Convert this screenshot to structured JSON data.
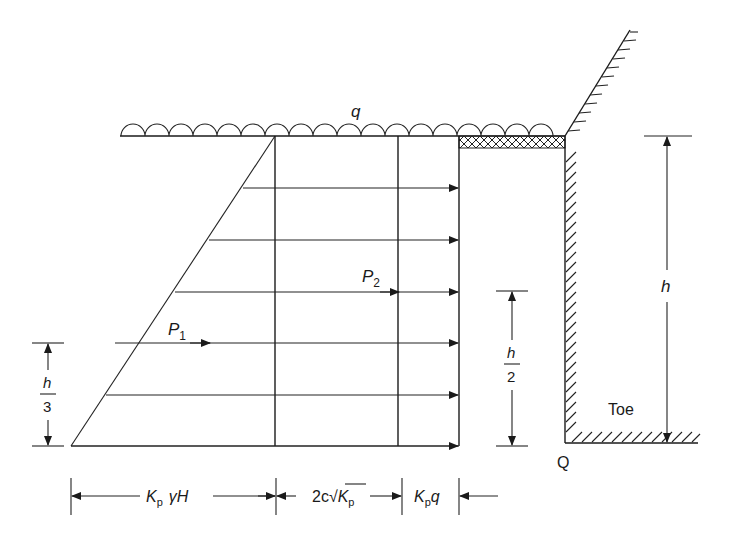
{
  "diagram": {
    "surcharge_label": "q",
    "force_labels": {
      "p1": {
        "symbol": "P",
        "subscript": "1"
      },
      "p2": {
        "symbol": "P",
        "subscript": "2"
      }
    },
    "dimensions": {
      "height_total": "h",
      "p1_height": {
        "numerator": "h",
        "denominator": "3"
      },
      "p2_height": {
        "numerator": "h",
        "denominator": "2"
      }
    },
    "pressure_widths": {
      "triangular": {
        "k": "K",
        "k_sub": "p",
        "rest": "γH"
      },
      "cohesion": {
        "prefix": "2c",
        "k": "K",
        "k_sub": "p"
      },
      "surcharge": {
        "k": "K",
        "k_sub": "p",
        "rest": "q"
      }
    },
    "wall_labels": {
      "toe": "Toe",
      "point": "Q"
    }
  }
}
